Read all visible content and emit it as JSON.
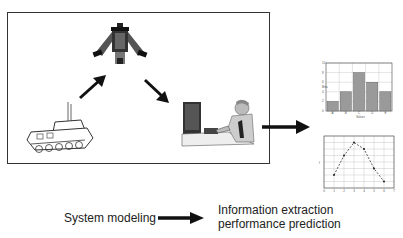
{
  "diagram": {
    "nodes": [
      {
        "id": "vehicle",
        "icon": "armored-vehicle-icon",
        "label": ""
      },
      {
        "id": "sensor",
        "icon": "reconnaissance-aircraft-icon",
        "label": ""
      },
      {
        "id": "analyst",
        "icon": "image-analyst-workstation-icon",
        "label": ""
      }
    ],
    "edges": [
      {
        "from": "vehicle",
        "to": "sensor"
      },
      {
        "from": "sensor",
        "to": "analyst"
      },
      {
        "from": "system-box",
        "to": "charts"
      }
    ]
  },
  "legend": {
    "left_label": "System modeling",
    "right_label_line1": "Information extraction",
    "right_label_line2": "performance prediction"
  },
  "colors": {
    "frame": "#333333",
    "arrow": "#111111",
    "bar_fill": "#9a9a9a",
    "grid": "#bbbbbb"
  },
  "chart_data": [
    {
      "type": "bar",
      "title": "",
      "categories": [
        "A",
        "B",
        "C",
        "D",
        "E"
      ],
      "values": [
        2,
        4,
        8,
        6,
        4
      ],
      "xlabel": "Values",
      "ylabel": "Bins",
      "ylim": [
        0,
        10
      ],
      "yticks": [
        0,
        2,
        4,
        6,
        8,
        10
      ],
      "grid": true
    },
    {
      "type": "line",
      "title": "",
      "x": [
        1,
        2,
        3,
        4,
        5,
        6
      ],
      "values": [
        2,
        5,
        7,
        6,
        3,
        1
      ],
      "xlabel": "",
      "ylabel": "f",
      "xlim": [
        0,
        7
      ],
      "ylim": [
        0,
        8
      ],
      "xticks": [
        0,
        1,
        2,
        3,
        4,
        5,
        6,
        7
      ],
      "yticks": [
        0,
        1,
        2,
        3,
        4,
        5,
        6,
        7,
        8
      ],
      "grid": true,
      "line_style": "dashed"
    }
  ]
}
